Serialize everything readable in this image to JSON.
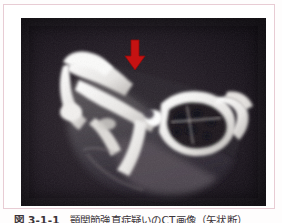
{
  "page": {
    "background_color": "#fefdfd",
    "frame_border_color": "#e8ccd4"
  },
  "figure": {
    "label": "図 3-1-1",
    "caption_text": "顎関節強直症疑いのCT画像（矢状断）",
    "photo": {
      "alt_name": "ct-scan-temporomandibular-joint",
      "background_color": "#0d0910",
      "modality": "CT",
      "view": "矢状断",
      "annotation": {
        "type": "arrow",
        "direction": "down",
        "color": "#cc1111",
        "x_pct": 45.0,
        "y_pct": 13.0,
        "meaning": "lesion-marker"
      }
    }
  }
}
